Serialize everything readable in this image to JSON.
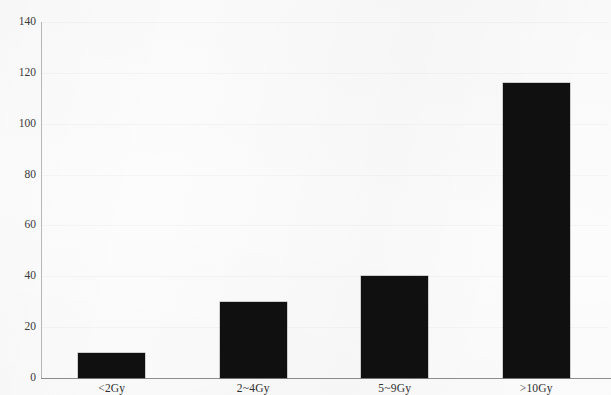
{
  "chart_data": {
    "type": "bar",
    "title": "",
    "xlabel": "",
    "ylabel": "",
    "categories": [
      "<2Gy",
      "2~4Gy",
      "5~9Gy",
      ">10Gy"
    ],
    "values": [
      10,
      30,
      40,
      116
    ],
    "ylim": [
      0,
      140
    ],
    "yticks": [
      0,
      20,
      40,
      60,
      80,
      100,
      120,
      140
    ],
    "ytick_labels": [
      "0",
      "20",
      "40",
      "60",
      "80",
      "100",
      "120",
      "140"
    ],
    "grid": false,
    "legend": null,
    "bar_color": "#111010",
    "axis_color": "#8e8e8e",
    "background_color": "#fcfcfc"
  },
  "axes": {
    "y_axis_name": "y-axis",
    "x_axis_name": "x-axis"
  }
}
